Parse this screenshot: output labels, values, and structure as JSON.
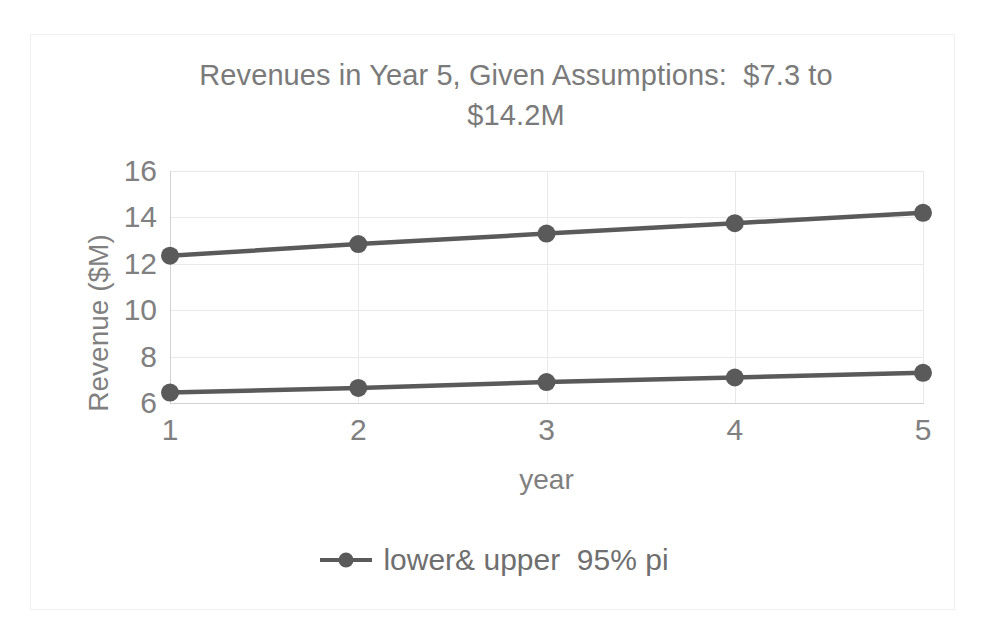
{
  "figure": {
    "background_color": "#ffffff",
    "frame_color": "#f0f0f0",
    "scan_artifacts": [
      "p",
      ",",
      "p"
    ]
  },
  "chart_data": {
    "type": "line",
    "title": "Revenues in Year 5, Given Assumptions:  $7.3 to\n$14.2M",
    "xlabel": "year",
    "ylabel": "Revenue ($M)",
    "x": [
      1,
      2,
      3,
      4,
      5
    ],
    "xtick_labels": [
      "1",
      "2",
      "3",
      "4",
      "5"
    ],
    "ytick_labels": [
      "6",
      "8",
      "10",
      "12",
      "14",
      "16"
    ],
    "yticks": [
      6,
      8,
      10,
      12,
      14,
      16
    ],
    "ylim": [
      6,
      16
    ],
    "xlim": [
      1,
      5
    ],
    "grid": "horizontal-and-vertical",
    "legend_position": "bottom-center",
    "legend_entries": [
      "lower& upper  95% pi"
    ],
    "series": [
      {
        "name": "upper 95% pi",
        "values": [
          12.35,
          12.85,
          13.3,
          13.75,
          14.2
        ],
        "color": "#5a5a5a",
        "marker": "circle"
      },
      {
        "name": "lower 95% pi",
        "values": [
          6.45,
          6.65,
          6.9,
          7.1,
          7.3
        ],
        "color": "#5a5a5a",
        "marker": "circle"
      }
    ],
    "annotations": {
      "year5_lower": "$7.3",
      "year5_upper": "$14.2M"
    },
    "colors": {
      "series": "#5a5a5a",
      "text": "#808080",
      "title": "#7a7a7a",
      "gridline": "#e9e9e9",
      "axis": "#d2d2d2"
    }
  }
}
